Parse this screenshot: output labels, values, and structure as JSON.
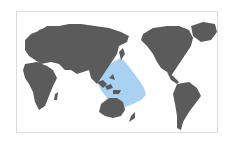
{
  "map": {
    "projection": "Pacific-centered world map",
    "colors": {
      "land": "#5b5b5b",
      "range": "#a9d2f2",
      "ocean": "#ffffff",
      "border": "#dcdcdc"
    },
    "highlighted_region": "Western and central tropical Pacific / Indo-Pacific distribution range"
  }
}
